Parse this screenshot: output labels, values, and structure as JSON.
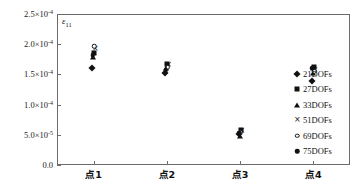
{
  "chart_data": {
    "type": "scatter",
    "title": "",
    "xlabel": "",
    "ylabel": "ε",
    "ylabel_sub": "11",
    "categories": [
      "点1",
      "点2",
      "点3",
      "点4"
    ],
    "ylim": [
      0,
      0.00025
    ],
    "yticks": [
      0,
      5e-05,
      0.0001,
      0.00015,
      0.0002,
      0.00025
    ],
    "ytick_labels": [
      "0.0",
      "5.0×10",
      "1.0×10",
      "1.5×10",
      "2.0×10",
      "2.5×10"
    ],
    "ytick_exponents": [
      "",
      "-5",
      "-4",
      "-4",
      "-4",
      "-4"
    ],
    "grid": false,
    "legend_position": "right",
    "series": [
      {
        "name": "21DOFs",
        "marker": "diamond",
        "values": [
          0.00016,
          0.000152,
          5.2e-05,
          0.000139
        ]
      },
      {
        "name": "27DOFs",
        "marker": "square",
        "values": [
          0.000186,
          0.000168,
          5.75e-05,
          0.000162
        ]
      },
      {
        "name": "33DOFs",
        "marker": "triangle",
        "values": [
          0.000178,
          0.00016,
          4.8e-05,
          0.000152
        ]
      },
      {
        "name": "51DOFs",
        "marker": "cross",
        "values": [
          0.000192,
          0.000165,
          5.6e-05,
          0.000158
        ]
      },
      {
        "name": "69DOFs",
        "marker": "open-circle",
        "values": [
          0.000197,
          0.000162,
          5.45e-05,
          0.000155
        ]
      },
      {
        "name": "75DOFs",
        "marker": "filled-circle",
        "values": [
          0.000182,
          0.000157,
          5.35e-05,
          0.00016
        ]
      }
    ]
  }
}
